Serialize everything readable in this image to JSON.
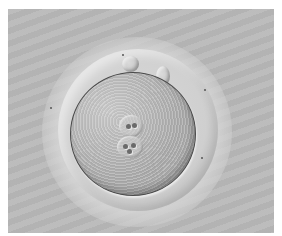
{
  "image": {
    "subject": "zygote-microscopy",
    "description": "Fertilized oocyte with two pronuclei and two polar bodies, differential interference contrast micrograph",
    "colors": {
      "background": "#b9b9b9",
      "border": "#ffffff",
      "cytoplasm": "#b2b2b2",
      "zona": "#d0d0d0",
      "membrane": "#4a4a4a"
    },
    "features": {
      "pronuclei_count": 2,
      "polar_bodies_count": 2
    }
  }
}
